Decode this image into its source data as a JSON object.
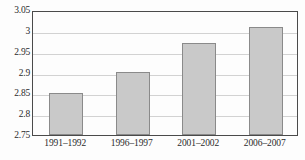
{
  "chart_data": {
    "type": "bar",
    "title": "",
    "subtitle": "",
    "xlabel": "",
    "ylabel": "",
    "categories": [
      "1991–1992",
      "1996–1997",
      "2001–2002",
      "2006–2007"
    ],
    "values": [
      2.85,
      2.9,
      2.97,
      3.01
    ],
    "series": [
      {
        "name": "",
        "values": [
          2.85,
          2.9,
          2.97,
          3.01
        ]
      }
    ],
    "ylim": [
      2.75,
      3.05
    ],
    "ytick_labels": [
      "2.75",
      "2.8",
      "2.85",
      "2.9",
      "2.95",
      "3",
      "3.05"
    ],
    "ytick_values": [
      2.75,
      2.8,
      2.85,
      2.9,
      2.95,
      3.0,
      3.05
    ],
    "grid": true,
    "grid_axis": "y",
    "legend": false,
    "legend_position": "none",
    "annotations": [],
    "colors": {
      "bar_fill": "#c9c9c9",
      "bar_edge": "#8a8a8a",
      "gridline": "#d2d2d2",
      "frame": "#4a4a4a",
      "text": "#2b2b2b",
      "background": "#fdfdfd"
    }
  }
}
